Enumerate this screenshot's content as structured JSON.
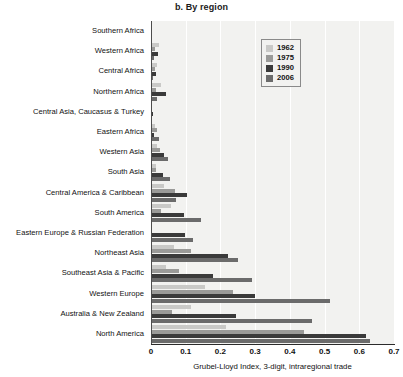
{
  "figure": {
    "panel_title": "b. By region"
  },
  "legend": {
    "position": "top-right-inside",
    "entries": [
      {
        "label": "1962",
        "color": "#c9c9c7"
      },
      {
        "label": "1975",
        "color": "#9a9a98"
      },
      {
        "label": "1990",
        "color": "#3a3a3a"
      },
      {
        "label": "2006",
        "color": "#6b6b6b"
      }
    ]
  },
  "axis": {
    "x_ticks": [
      "0",
      "0.1",
      "0.2",
      "0.3",
      "0.4",
      "0.5",
      "0.6",
      "0.7"
    ],
    "x_tick_values": [
      0,
      0.1,
      0.2,
      0.3,
      0.4,
      0.5,
      0.6,
      0.7
    ],
    "x_label": "Grubel-Lloyd Index, 3-digit, intraregional trade",
    "x_min": 0,
    "x_max": 0.7
  },
  "chart_data": {
    "type": "bar",
    "orientation": "horizontal",
    "title": "b. By region",
    "xlabel": "Grubel-Lloyd Index, 3-digit, intraregional trade",
    "ylabel": "",
    "xlim": [
      0,
      0.7
    ],
    "grid": true,
    "legend_position": "top-right-inside",
    "categories": [
      "Southern Africa",
      "Western Africa",
      "Central Africa",
      "Northern Africa",
      "Central Asia, Caucasus & Turkey",
      "Eastern Africa",
      "Western Asia",
      "South Asia",
      "Central America & Caribbean",
      "South America",
      "Eastern Europe & Russian Federation",
      "Northeast Asia",
      "Southeast Asia & Pacific",
      "Western Europe",
      "Australia & New Zealand",
      "North America"
    ],
    "series": [
      {
        "name": "1962",
        "color": "#c9c9c7",
        "values": [
          0.0,
          0.023,
          0.018,
          0.03,
          0.0,
          0.012,
          0.017,
          0.013,
          0.038,
          0.058,
          0.0,
          0.065,
          0.043,
          0.155,
          0.115,
          0.215
        ]
      },
      {
        "name": "1975",
        "color": "#9a9a98",
        "values": [
          0.0,
          0.012,
          0.012,
          0.013,
          0.002,
          0.018,
          0.026,
          0.014,
          0.07,
          0.03,
          0.0,
          0.115,
          0.082,
          0.235,
          0.06,
          0.44
        ]
      },
      {
        "name": "1990",
        "color": "#3a3a3a",
        "values": [
          0.004,
          0.02,
          0.015,
          0.042,
          0.006,
          0.01,
          0.037,
          0.035,
          0.104,
          0.094,
          0.098,
          0.222,
          0.18,
          0.3,
          0.245,
          0.62
        ]
      },
      {
        "name": "2006",
        "color": "#6b6b6b",
        "values": [
          0.0,
          0.008,
          0.006,
          0.018,
          0.004,
          0.022,
          0.05,
          0.056,
          0.073,
          0.145,
          0.12,
          0.25,
          0.29,
          0.515,
          0.465,
          0.63
        ]
      }
    ]
  }
}
